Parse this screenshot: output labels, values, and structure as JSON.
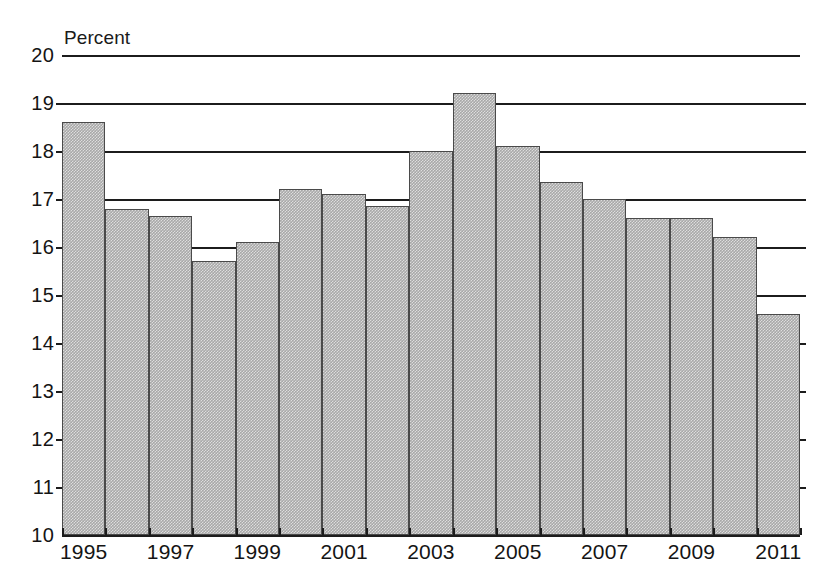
{
  "chart_data": {
    "type": "bar",
    "title": "",
    "subtitle": "",
    "xlabel": "",
    "ylabel": "Percent",
    "ylim": [
      10,
      20
    ],
    "ytick_step": 1,
    "yticks": [
      10,
      11,
      12,
      13,
      14,
      15,
      16,
      17,
      18,
      19,
      20
    ],
    "grid": true,
    "legend": null,
    "categories": [
      "1995",
      "1996",
      "1997",
      "1998",
      "1999",
      "2000",
      "2001",
      "2002",
      "2003",
      "2004",
      "2005",
      "2006",
      "2007",
      "2008",
      "2009",
      "2010",
      "2011"
    ],
    "xtick_labels": [
      "1995",
      "1997",
      "1999",
      "2001",
      "2003",
      "2005",
      "2007",
      "2009",
      "2011"
    ],
    "values": [
      18.6,
      16.8,
      16.65,
      15.7,
      16.1,
      17.2,
      17.1,
      16.85,
      18.0,
      19.2,
      18.1,
      17.35,
      17.0,
      16.6,
      16.6,
      16.2,
      14.6
    ],
    "bar_color": "#a8a8a8",
    "bar_edge_color": "#4a4a4a",
    "axis_color": "#1c1c1c"
  },
  "axis": {
    "unit_label": "Percent"
  }
}
